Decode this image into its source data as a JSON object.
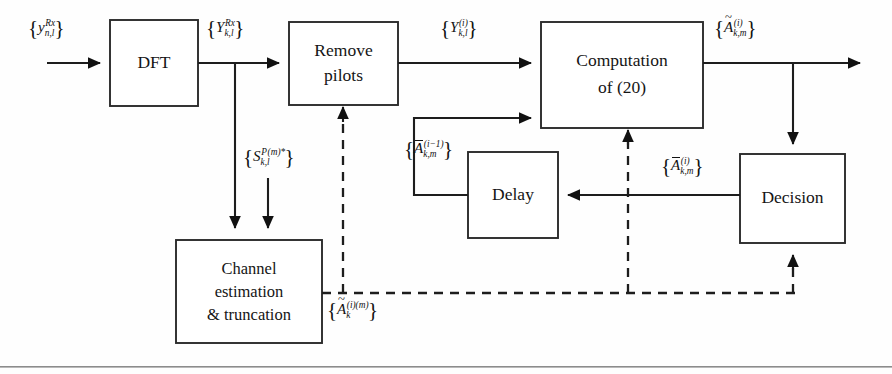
{
  "figure": {
    "kind": "block-diagram",
    "background_color": "#fefefe",
    "line_color": "#1d1d1d",
    "block_fill": "#ffffff",
    "block_stroke": "#2b2b2b"
  },
  "blocks": [
    {
      "id": "dft",
      "label_line1": "DFT",
      "label_line2": "",
      "x": 110,
      "y": 20,
      "w": 88,
      "h": 86
    },
    {
      "id": "remove",
      "label_line1": "Remove",
      "label_line2": "pilots",
      "x": 289,
      "y": 22,
      "w": 109,
      "h": 83
    },
    {
      "id": "compute",
      "label_line1": "Computation",
      "label_line2": "of (20)",
      "x": 541,
      "y": 22,
      "w": 162,
      "h": 106
    },
    {
      "id": "channel",
      "label_line1": "Channel",
      "label_line2": "estimation",
      "label_line3": "& truncation",
      "x": 176,
      "y": 240,
      "w": 146,
      "h": 103
    },
    {
      "id": "delay",
      "label_line1": "Delay",
      "label_line2": "",
      "x": 468,
      "y": 152,
      "w": 90,
      "h": 86
    },
    {
      "id": "decision",
      "label_line1": "Decision",
      "label_line2": "",
      "x": 740,
      "y": 154,
      "w": 105,
      "h": 89
    }
  ],
  "signals": [
    {
      "id": "input",
      "plain": "{y_{n,l}^{Rx}}",
      "x": 28,
      "y": 18
    },
    {
      "id": "dft-out",
      "plain": "{Y_{k,l}^{Rx}}",
      "x": 206,
      "y": 18
    },
    {
      "id": "pilot-conj",
      "plain": "{S_{k,l}^{P(m)*}}",
      "x": 243,
      "y": 147
    },
    {
      "id": "remove-out",
      "plain": "{Y_{k,l}^{(i)}}",
      "x": 440,
      "y": 18
    },
    {
      "id": "compute-out",
      "plain": "{A~_{k,m}^{(i)}}",
      "x": 715,
      "y": 18
    },
    {
      "id": "delay-in-label",
      "plain": "{A-_{k,m}^{(i-1)}}",
      "x": 404,
      "y": 140
    },
    {
      "id": "decision-in",
      "plain": "{A-_{k,m}^{(i)}}",
      "x": 662,
      "y": 157
    },
    {
      "id": "channel-out",
      "plain": "{A~_{k}^{(i)(m)}}",
      "x": 327,
      "y": 300
    }
  ],
  "connections": [
    {
      "from": "external-input",
      "to": "dft",
      "style": "solid"
    },
    {
      "from": "dft",
      "to": "remove",
      "style": "solid"
    },
    {
      "from": "dft",
      "to": "channel",
      "style": "solid"
    },
    {
      "from": "pilot-source",
      "to": "channel",
      "style": "solid"
    },
    {
      "from": "remove",
      "to": "compute",
      "style": "solid"
    },
    {
      "from": "delay",
      "to": "compute",
      "style": "solid"
    },
    {
      "from": "compute",
      "to": "output",
      "style": "solid"
    },
    {
      "from": "compute",
      "to": "decision",
      "style": "solid"
    },
    {
      "from": "decision",
      "to": "delay",
      "style": "solid"
    },
    {
      "from": "channel",
      "to": "remove",
      "style": "dashed"
    },
    {
      "from": "channel",
      "to": "compute",
      "style": "dashed"
    },
    {
      "from": "channel",
      "to": "decision",
      "style": "dashed"
    }
  ],
  "footer_rule": {
    "visible": true,
    "y": 366,
    "color": "#8c8c8c"
  }
}
